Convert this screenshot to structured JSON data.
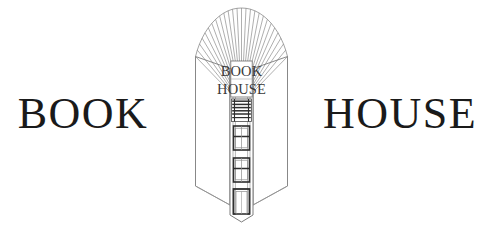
{
  "logo": {
    "wordmark_left": "BOOK",
    "wordmark_right": "HOUSE",
    "emblem": {
      "name": "open-book-building-emblem",
      "sign_line1": "BOOK",
      "sign_line2": "HOUSE",
      "page_count": 26,
      "window_rows": 3,
      "has_entrance_door": true
    },
    "colors": {
      "background": "#ffffff",
      "wordmark_text": "#1a1a1a",
      "sign_text": "#3a3a3a",
      "line_art": "#6e6e6e",
      "line_art_dark": "#2e2e2e",
      "page_line": "#8c8c8c"
    }
  }
}
